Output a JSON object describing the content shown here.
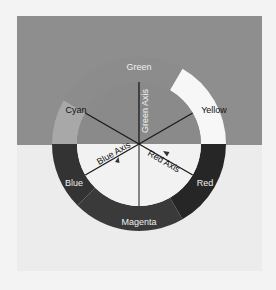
{
  "diagram": {
    "title": "",
    "center": [
      139,
      144
    ],
    "outer_radius": 87,
    "inner_radius": 62,
    "colors": {
      "panel_top": "#8e8e8e",
      "panel_bottom": "#ececec",
      "inner_top": "#8a8a8a",
      "inner_bottom": "#f2f2f2",
      "green": "#8c8c8c",
      "yellow": "#f7f7f7",
      "red": "#262626",
      "magenta": "#3a3a3a",
      "blue": "#333333",
      "cyan": "#a8a8a8",
      "spoke": "#1a1a1a"
    },
    "segments": [
      {
        "name": "Green",
        "label": "Green"
      },
      {
        "name": "Yellow",
        "label": "Yellow"
      },
      {
        "name": "Red",
        "label": "Red"
      },
      {
        "name": "Magenta",
        "label": "Magenta"
      },
      {
        "name": "Blue",
        "label": "Blue"
      },
      {
        "name": "Cyan",
        "label": "Cyan"
      }
    ],
    "axes": {
      "green": "Green Axis",
      "blue": "Blue Axis",
      "red": "Red Axis"
    }
  }
}
